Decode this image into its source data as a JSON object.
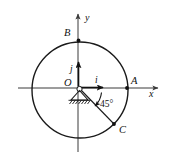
{
  "figure": {
    "background_color": "#ffffff",
    "stroke_color": "#1a1a1a",
    "labels": {
      "axis_x": "x",
      "axis_y": "y",
      "origin": "O",
      "point_a": "A",
      "point_b": "B",
      "point_c": "C",
      "vector_i": "i",
      "vector_j": "j",
      "angle": "45°"
    },
    "geometry": {
      "circle_center_x": 80,
      "circle_center_y": 90,
      "circle_radius": 48,
      "x_axis_y": 88,
      "y_axis_x": 78,
      "point_a_x": 127,
      "point_a_y": 88,
      "point_b_x": 78,
      "point_b_y": 40,
      "point_c_x": 114,
      "point_c_y": 124,
      "angle_degrees": 45
    }
  }
}
